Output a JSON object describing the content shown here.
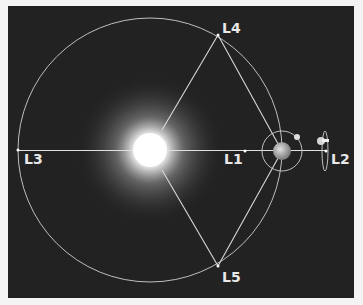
{
  "diagram": {
    "type": "lagrange-points",
    "colors": {
      "background": "#222222",
      "page": "#f4f4f4",
      "lines": "#d8d8d8",
      "labels": "#e8e8e8"
    },
    "bodies": {
      "sun": {
        "cx": 150,
        "cy": 150,
        "glow_radius": 75
      },
      "earth": {
        "cx": 282,
        "cy": 151,
        "r": 9
      },
      "moon": {
        "cx": 297,
        "cy": 137,
        "r": 3
      },
      "satellite": {
        "cx": 322,
        "cy": 141
      }
    },
    "orbits": {
      "earth_orbit": {
        "cx": 150,
        "cy": 150,
        "r": 132
      },
      "moon_orbit": {
        "cx": 282,
        "cy": 151,
        "r": 20
      },
      "l2_halo": {
        "cx": 325,
        "cy": 151,
        "rx": 3,
        "ry": 20
      }
    },
    "points": [
      {
        "id": "L1",
        "label": "L1",
        "x": 245,
        "y": 151,
        "lx": 224,
        "ly": 164
      },
      {
        "id": "L2",
        "label": "L2",
        "x": 326,
        "y": 151,
        "lx": 331,
        "ly": 164
      },
      {
        "id": "L3",
        "label": "L3",
        "x": 18,
        "y": 150,
        "lx": 24,
        "ly": 164
      },
      {
        "id": "L4",
        "label": "L4",
        "x": 218,
        "y": 35,
        "lx": 222,
        "ly": 33
      },
      {
        "id": "L5",
        "label": "L5",
        "x": 218,
        "y": 266,
        "lx": 222,
        "ly": 282
      }
    ]
  }
}
